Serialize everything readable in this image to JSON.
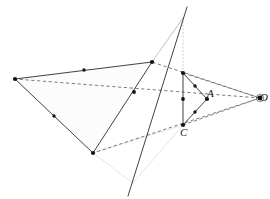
{
  "figure": {
    "width": 270,
    "height": 199,
    "background": "#ffffff",
    "colors": {
      "solid_stroke": "#2b2b2b",
      "dashed_stroke": "#58585e",
      "faint_stroke": "#d8d8de",
      "dotted_stroke": "#b9b9c2",
      "fill_tint": "#fcfcfd",
      "point_fill": "#121212",
      "label_color": "#1b1b1b"
    },
    "stroke_widths": {
      "solid": 0.9,
      "dashed": 0.8,
      "faint": 0.7,
      "dotted": 0.7
    },
    "dash_patterns": {
      "dashed": "3.2,2.6",
      "dotted": "1.2,2.4"
    }
  },
  "labels": [
    {
      "id": "label-A",
      "text": "A",
      "x": 207,
      "y": 88
    },
    {
      "id": "label-C",
      "text": "C",
      "x": 180,
      "y": 127
    },
    {
      "id": "label-O",
      "text": "O",
      "x": 260,
      "y": 92
    }
  ],
  "points": [
    {
      "id": "big-left",
      "x": 15,
      "y": 79,
      "r": 2.1
    },
    {
      "id": "big-top-right",
      "x": 152,
      "y": 62,
      "r": 2.1
    },
    {
      "id": "big-bottom",
      "x": 93,
      "y": 153,
      "r": 2.1
    },
    {
      "id": "big-top-mid",
      "x": 84,
      "y": 70,
      "r": 1.7
    },
    {
      "id": "big-left-mid",
      "x": 54,
      "y": 116,
      "r": 1.7
    },
    {
      "id": "big-cross-mid",
      "x": 134,
      "y": 92,
      "r": 1.9
    },
    {
      "id": "small-top",
      "x": 183,
      "y": 73,
      "r": 2.1
    },
    {
      "id": "small-bottom",
      "x": 183,
      "y": 125,
      "r": 2.1
    },
    {
      "id": "small-right",
      "x": 207,
      "y": 99,
      "r": 2.1
    },
    {
      "id": "small-top-mid",
      "x": 195,
      "y": 86,
      "r": 1.7
    },
    {
      "id": "small-left-mid",
      "x": 183,
      "y": 99,
      "r": 1.9
    },
    {
      "id": "small-bot-mid",
      "x": 195,
      "y": 112,
      "r": 1.7
    },
    {
      "id": "center-O",
      "x": 260,
      "y": 98,
      "r": 2.4
    }
  ],
  "solid_segments": [
    {
      "id": "big-edge-top",
      "x1": 15,
      "y1": 79,
      "x2": 152,
      "y2": 62
    },
    {
      "id": "big-edge-left",
      "x1": 15,
      "y1": 79,
      "x2": 93,
      "y2": 153
    },
    {
      "id": "big-edge-right",
      "x1": 152,
      "y1": 62,
      "x2": 93,
      "y2": 153
    },
    {
      "id": "small-edge-left",
      "x1": 183,
      "y1": 73,
      "x2": 183,
      "y2": 125
    },
    {
      "id": "small-edge-top",
      "x1": 183,
      "y1": 73,
      "x2": 207,
      "y2": 99
    },
    {
      "id": "small-edge-bottom",
      "x1": 183,
      "y1": 125,
      "x2": 207,
      "y2": 99
    },
    {
      "id": "cevian-long",
      "x1": 187,
      "y1": 7,
      "x2": 128,
      "y2": 196
    }
  ],
  "dashed_segments": [
    {
      "id": "ray-O-to-big-left",
      "x1": 260,
      "y1": 98,
      "x2": 15,
      "y2": 79
    },
    {
      "id": "ray-O-to-big-topright",
      "x1": 260,
      "y1": 98,
      "x2": 152,
      "y2": 62
    },
    {
      "id": "ray-O-to-big-bottom",
      "x1": 260,
      "y1": 98,
      "x2": 93,
      "y2": 153
    },
    {
      "id": "chord-smalltop-O",
      "x1": 183,
      "y1": 73,
      "x2": 260,
      "y2": 98
    },
    {
      "id": "chord-smallbottom-O",
      "x1": 183,
      "y1": 125,
      "x2": 260,
      "y2": 98
    }
  ],
  "dotted_segments": [
    {
      "id": "dotted-vertical-small-top",
      "x1": 183,
      "y1": 18,
      "x2": 183,
      "y2": 73
    },
    {
      "id": "dotted-bigtopright-up",
      "x1": 152,
      "y1": 62,
      "x2": 183,
      "y2": 18
    },
    {
      "id": "dotted-apex-to-bigbottom",
      "x1": 183,
      "y1": 18,
      "x2": 152,
      "y2": 62
    }
  ],
  "faint_segments": [
    {
      "id": "faint-left",
      "x1": 93,
      "y1": 153,
      "x2": 133,
      "y2": 183
    },
    {
      "id": "faint-right",
      "x1": 133,
      "y1": 183,
      "x2": 183,
      "y2": 125
    },
    {
      "id": "faint-upper",
      "x1": 93,
      "y1": 153,
      "x2": 183,
      "y2": 125
    },
    {
      "id": "faint-tail",
      "x1": 152,
      "y1": 62,
      "x2": 183,
      "y2": 18
    }
  ],
  "regions": [
    {
      "id": "big-triangle-fill",
      "points": "15,79 152,62 93,153"
    }
  ]
}
